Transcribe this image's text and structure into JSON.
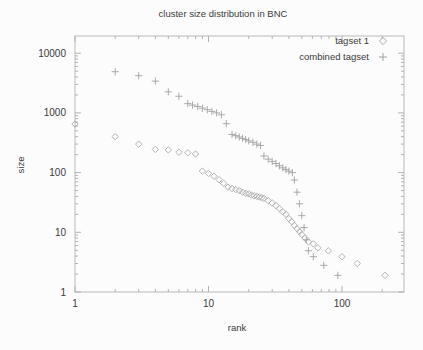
{
  "title": "cluster size distribution in BNC",
  "axes": {
    "x_label": "rank",
    "y_label": "size"
  },
  "legend": {
    "items": [
      {
        "label": "tagset 1",
        "marker": "diamond"
      },
      {
        "label": "combined tagset",
        "marker": "plus"
      }
    ]
  },
  "colors": {
    "background": "#fcfcfc",
    "axis": "#b9b9b9",
    "tick": "#b2b2b2",
    "text": "#3a3a3a",
    "diamond_marker": "#ababab",
    "plus_marker": "#a2a2a2"
  },
  "chart_data": {
    "type": "scatter",
    "title": "cluster size distribution in BNC",
    "xlabel": "rank",
    "ylabel": "size",
    "x_scale": "log",
    "y_scale": "log",
    "xlim": [
      1,
      300
    ],
    "ylim": [
      1,
      18000
    ],
    "xticks": [
      1,
      10,
      100
    ],
    "yticks": [
      1,
      10,
      100,
      1000,
      10000
    ],
    "grid": false,
    "legend_position": "top-right-inside",
    "series": [
      {
        "name": "tagset 1",
        "marker": "diamond",
        "points": [
          [
            1,
            650
          ],
          [
            2,
            400
          ],
          [
            3,
            300
          ],
          [
            4,
            245
          ],
          [
            5,
            240
          ],
          [
            6,
            220
          ],
          [
            7,
            215
          ],
          [
            8,
            205
          ],
          [
            9,
            106
          ],
          [
            10,
            97
          ],
          [
            11,
            87
          ],
          [
            12,
            76
          ],
          [
            13,
            66
          ],
          [
            14,
            57
          ],
          [
            15,
            54
          ],
          [
            16,
            52
          ],
          [
            17,
            50
          ],
          [
            18,
            47
          ],
          [
            19,
            45
          ],
          [
            20,
            44
          ],
          [
            21,
            42
          ],
          [
            22,
            41
          ],
          [
            23,
            40
          ],
          [
            24,
            39
          ],
          [
            25,
            38
          ],
          [
            26,
            37
          ],
          [
            28,
            34
          ],
          [
            30,
            31
          ],
          [
            32,
            28
          ],
          [
            34,
            25
          ],
          [
            36,
            22
          ],
          [
            38,
            20
          ],
          [
            40,
            17
          ],
          [
            42,
            15
          ],
          [
            44,
            13
          ],
          [
            46,
            11.5
          ],
          [
            48,
            10.3
          ],
          [
            50,
            9.2
          ],
          [
            53,
            8
          ],
          [
            56,
            6.9
          ],
          [
            61,
            6.4
          ],
          [
            66,
            5.5
          ],
          [
            79,
            4.9
          ],
          [
            100,
            3.9
          ],
          [
            130,
            3
          ],
          [
            210,
            1.9
          ]
        ]
      },
      {
        "name": "combined tagset",
        "marker": "plus",
        "points": [
          [
            2,
            4900
          ],
          [
            3,
            4200
          ],
          [
            4,
            3400
          ],
          [
            5,
            2250
          ],
          [
            6,
            1900
          ],
          [
            7,
            1430
          ],
          [
            7.6,
            1350
          ],
          [
            8.3,
            1280
          ],
          [
            9,
            1200
          ],
          [
            9.8,
            1130
          ],
          [
            10.6,
            1060
          ],
          [
            11.5,
            1000
          ],
          [
            12.5,
            930
          ],
          [
            13.6,
            660
          ],
          [
            15,
            435
          ],
          [
            16,
            415
          ],
          [
            17,
            395
          ],
          [
            18,
            375
          ],
          [
            19,
            357
          ],
          [
            20,
            340
          ],
          [
            21.5,
            322
          ],
          [
            23,
            300
          ],
          [
            24.5,
            285
          ],
          [
            26,
            190
          ],
          [
            28,
            168
          ],
          [
            30,
            154
          ],
          [
            32,
            142
          ],
          [
            34,
            130
          ],
          [
            36,
            120
          ],
          [
            38,
            112
          ],
          [
            40,
            106
          ],
          [
            42.5,
            100
          ],
          [
            44,
            75
          ],
          [
            46,
            47
          ],
          [
            48,
            30
          ],
          [
            50,
            19
          ],
          [
            52,
            12
          ],
          [
            54,
            7.5
          ],
          [
            56,
            4.9
          ],
          [
            61,
            3.9
          ],
          [
            73,
            2.8
          ],
          [
            93,
            1.9
          ]
        ]
      }
    ]
  }
}
